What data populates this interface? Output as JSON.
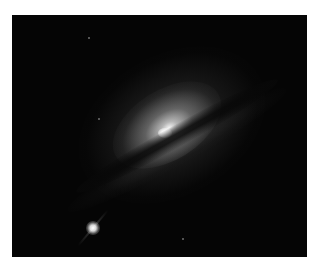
{
  "image": {
    "subject": "edge-on spiral galaxy with dust lane and bright point source",
    "description": "Grayscale astronomical photograph of a lenticular/spiral galaxy seen nearly edge-on with a dark dust lane crossing diagonally below a bright core; a bright star-like point source at lower left",
    "colors": {
      "background": "#ffffff",
      "sky": "#050505",
      "core": "#ffffff"
    }
  }
}
